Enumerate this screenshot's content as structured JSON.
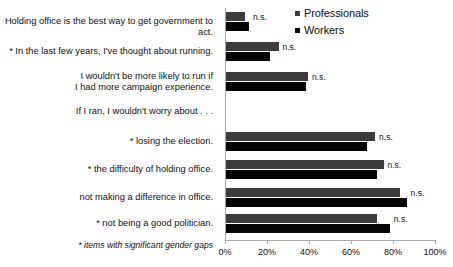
{
  "chart_data": {
    "type": "bar",
    "orientation": "horizontal",
    "title": "",
    "xlabel": "",
    "ylabel": "",
    "xlim": [
      0,
      100
    ],
    "xticks": [
      0,
      20,
      40,
      60,
      80,
      100
    ],
    "xticklabels": [
      "0%",
      "20%",
      "40%",
      "60%",
      "80%",
      "100%"
    ],
    "grid": false,
    "legend_position": "top-right",
    "legend": [
      "Professionals",
      "Workers"
    ],
    "categories": [
      "Holding office is the best way to get government to act.",
      "* In the last few years, I've thought about running.",
      "I wouldn't be more likely to run if\nI had more campaign experience.",
      "If I ran, I wouldn't worry about . . .",
      "* losing the election.",
      "* the difficulty of holding office.",
      "not making a difference in office.",
      "* not being a good politician."
    ],
    "series": [
      {
        "name": "Professionals",
        "color": "#3c3c3c",
        "values": [
          9,
          25,
          39,
          null,
          71,
          75,
          83,
          72
        ]
      },
      {
        "name": "Workers",
        "color": "#050505",
        "values": [
          11,
          21,
          38,
          null,
          67,
          72,
          86,
          78
        ]
      }
    ],
    "annotations": [
      "n.s.",
      "n.s.",
      "n.s.",
      null,
      "n.s.",
      "n.s.",
      "n.s.",
      "n.s."
    ],
    "footnote": "* items with significant gender gaps"
  }
}
